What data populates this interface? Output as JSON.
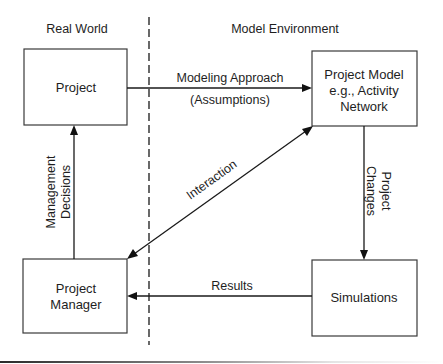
{
  "diagram": {
    "regions": {
      "left_label": "Real World",
      "right_label": "Model Environment"
    },
    "nodes": {
      "project": {
        "lines": [
          "Project"
        ]
      },
      "project_model": {
        "lines": [
          "Project Model",
          "e.g., Activity",
          "Network"
        ]
      },
      "project_manager": {
        "lines": [
          "Project",
          "Manager"
        ]
      },
      "simulations": {
        "lines": [
          "Simulations"
        ]
      }
    },
    "edges": {
      "modeling": {
        "from": "Project",
        "to": "Project Model",
        "lines": [
          "Modeling Approach",
          "(Assumptions)"
        ]
      },
      "changes": {
        "from": "Project Model",
        "to": "Simulations",
        "lines": [
          "Project",
          "Changes"
        ]
      },
      "results": {
        "from": "Simulations",
        "to": "Project Manager",
        "lines": [
          "Results"
        ]
      },
      "decisions": {
        "from": "Project Manager",
        "to": "Project",
        "lines": [
          "Management",
          "Decisions"
        ]
      },
      "interaction": {
        "between": [
          "Project Manager",
          "Project Model"
        ],
        "direction": "bidirectional",
        "lines": [
          "Interaction"
        ]
      }
    },
    "colors": {
      "line": "#1a1a1a",
      "box_border": "#3a3a3a",
      "text": "#1e1e1e",
      "background": "#ffffff"
    }
  }
}
